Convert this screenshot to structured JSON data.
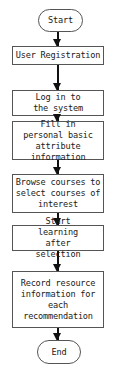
{
  "flowchart": {
    "nodes": [
      {
        "id": "start",
        "type": "terminal",
        "label": "Start"
      },
      {
        "id": "user-registration",
        "type": "process",
        "label": "User Registration"
      },
      {
        "id": "log-in",
        "type": "process",
        "label": "Log in to the system"
      },
      {
        "id": "fill-in",
        "type": "process",
        "label": "Fill in personal basic attribute information"
      },
      {
        "id": "browse",
        "type": "process",
        "label": "Browse courses to select courses of interest"
      },
      {
        "id": "start-learning",
        "type": "process",
        "label": "Start learning after selection"
      },
      {
        "id": "record",
        "type": "process",
        "label": "Record resource information for each recommendation"
      },
      {
        "id": "end",
        "type": "terminal",
        "label": "End"
      }
    ],
    "edges": [
      [
        "start",
        "user-registration"
      ],
      [
        "user-registration",
        "log-in"
      ],
      [
        "log-in",
        "fill-in"
      ],
      [
        "fill-in",
        "browse"
      ],
      [
        "browse",
        "start-learning"
      ],
      [
        "start-learning",
        "record"
      ],
      [
        "record",
        "end"
      ]
    ]
  }
}
